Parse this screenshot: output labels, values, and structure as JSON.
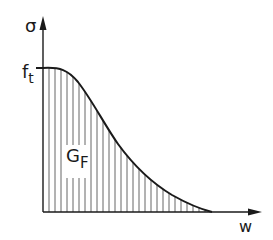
{
  "diagram": {
    "y_axis_label": "σ",
    "x_axis_label": "w",
    "peak_label_main": "f",
    "peak_label_sub": "t",
    "area_label_main": "G",
    "area_label_sub": "F",
    "colors": {
      "line": "#1a1a1a",
      "hatch": "#555555",
      "background": "#ffffff"
    }
  }
}
